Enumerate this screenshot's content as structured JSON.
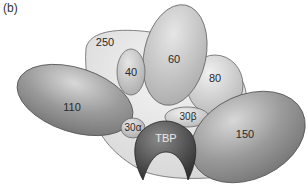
{
  "panel_label": "(b)",
  "diagram": {
    "subunits": [
      {
        "id": "250",
        "label": "250"
      },
      {
        "id": "110",
        "label": "110"
      },
      {
        "id": "40",
        "label": "40"
      },
      {
        "id": "60",
        "label": "60"
      },
      {
        "id": "80",
        "label": "80"
      },
      {
        "id": "30b",
        "label": "30β"
      },
      {
        "id": "30a",
        "label": "30α"
      },
      {
        "id": "tbp",
        "label": "TBP"
      },
      {
        "id": "150",
        "label": "150"
      }
    ],
    "colors": {
      "core_fill": "#dcdcdc",
      "light_subunit": "#c4c4c4",
      "dark_subunit": "#8c8c8c",
      "tbp": "#4a4a4a",
      "outline": "#555555"
    }
  }
}
